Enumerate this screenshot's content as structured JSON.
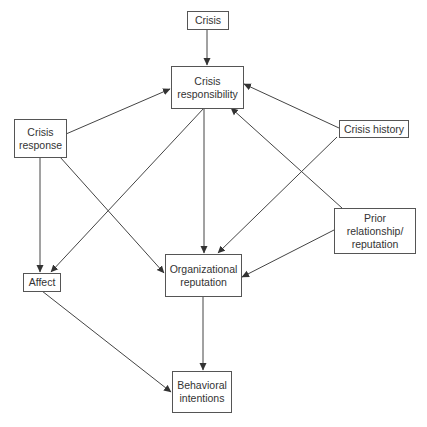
{
  "diagram": {
    "nodes": [
      {
        "id": "crisis",
        "label": "Crisis"
      },
      {
        "id": "crisis_responsibility",
        "label": "Crisis\nresponsibility"
      },
      {
        "id": "crisis_response",
        "label": "Crisis\nresponse"
      },
      {
        "id": "crisis_history",
        "label": "Crisis history"
      },
      {
        "id": "prior_relationship",
        "label": "Prior\nrelationship/\nreputation"
      },
      {
        "id": "affect",
        "label": "Affect"
      },
      {
        "id": "organizational_reputation",
        "label": "Organizational\nreputation"
      },
      {
        "id": "behavioral_intentions",
        "label": "Behavioral\nintentions"
      }
    ],
    "edges": [
      {
        "from": "crisis",
        "to": "crisis_responsibility"
      },
      {
        "from": "crisis_response",
        "to": "crisis_responsibility"
      },
      {
        "from": "crisis_history",
        "to": "crisis_responsibility"
      },
      {
        "from": "prior_relationship",
        "to": "crisis_responsibility"
      },
      {
        "from": "crisis_responsibility",
        "to": "affect"
      },
      {
        "from": "crisis_responsibility",
        "to": "organizational_reputation"
      },
      {
        "from": "crisis_response",
        "to": "affect"
      },
      {
        "from": "crisis_response",
        "to": "organizational_reputation"
      },
      {
        "from": "crisis_history",
        "to": "organizational_reputation"
      },
      {
        "from": "prior_relationship",
        "to": "organizational_reputation"
      },
      {
        "from": "affect",
        "to": "behavioral_intentions"
      },
      {
        "from": "organizational_reputation",
        "to": "behavioral_intentions"
      }
    ]
  }
}
